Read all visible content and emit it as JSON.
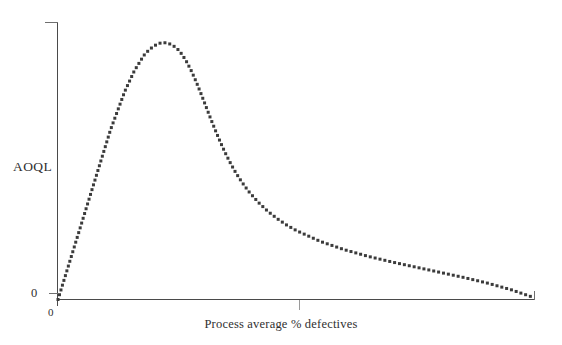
{
  "chart_data": {
    "type": "line",
    "title": "",
    "subtitle": "",
    "xlabel": "Process average % defectives",
    "ylabel": "AOQL",
    "x_tick_labels": [
      "0"
    ],
    "y_tick_labels": [
      "0"
    ],
    "grid": false,
    "legend": null,
    "annotations": [],
    "marker_style": "dotted",
    "series": [
      {
        "name": "Average outgoing quality",
        "x": [
          0.0,
          1.0,
          2.0,
          3.0,
          4.0,
          5.0,
          6.0,
          7.0,
          8.0,
          9.0,
          10.0,
          11.0,
          12.0,
          13.0,
          14.0,
          15.0,
          16.0,
          17.0,
          18.0,
          19.0,
          20.0,
          21.0,
          22.0,
          23.0,
          24.0,
          25.0,
          26.0,
          27.0,
          28.0,
          29.0,
          30.0,
          31.0,
          32.0,
          33.0,
          34.0,
          35.0,
          36.0,
          37.0,
          38.0,
          39.0,
          40.0,
          42.0,
          44.0,
          46.0,
          48.0,
          50.0,
          55.0,
          60.0,
          65.0,
          70.0,
          75.0,
          80.0,
          85.0,
          90.0,
          95.0,
          100.0
        ],
        "y": [
          0.0,
          6.0,
          12.0,
          18.0,
          24.0,
          30.0,
          36.0,
          42.0,
          48.0,
          54.0,
          60.0,
          66.0,
          71.0,
          76.0,
          81.0,
          85.0,
          89.0,
          92.0,
          95.0,
          97.0,
          98.5,
          99.6,
          100.0,
          99.8,
          99.0,
          97.6,
          95.4,
          92.4,
          88.8,
          84.6,
          80.0,
          75.2,
          70.4,
          65.8,
          61.4,
          57.3,
          53.6,
          50.2,
          47.2,
          44.5,
          42.0,
          37.8,
          34.3,
          31.4,
          28.9,
          26.8,
          22.6,
          19.4,
          16.8,
          14.6,
          12.6,
          10.6,
          8.6,
          6.4,
          3.8,
          0.6
        ]
      }
    ],
    "xlim": [
      0,
      100
    ],
    "ylim": [
      0,
      108
    ],
    "peak": {
      "x": 22.0,
      "y": 100.0,
      "meaning": "AOQL is the maximum of the average outgoing quality curve"
    }
  },
  "axes": {
    "y_axis_label": "AOQL",
    "y_zero_label": "0",
    "x_zero_label": "0",
    "x_axis_label": "Process average % defectives"
  },
  "colors": {
    "background": "#ffffff",
    "axis": "#4a4a4a",
    "curve_dots": "#3b3b3b",
    "text": "#2f2f2f"
  }
}
